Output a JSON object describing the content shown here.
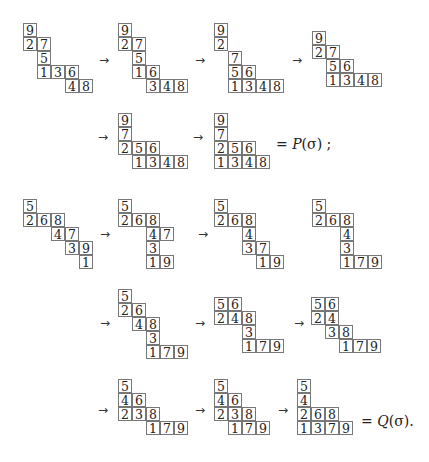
{
  "cell_size": 14,
  "arrow_glyph": "→",
  "tableaux": [
    {
      "id": "p1",
      "x": 23,
      "y": 23,
      "rows": [
        [
          0,
          "9"
        ],
        [
          0,
          "27"
        ],
        [
          1,
          "5"
        ],
        [
          1,
          "136"
        ],
        [
          3,
          "48"
        ]
      ]
    },
    {
      "id": "p2",
      "x": 118,
      "y": 23,
      "rows": [
        [
          0,
          "9"
        ],
        [
          0,
          "27"
        ],
        [
          1,
          "5"
        ],
        [
          1,
          "16"
        ],
        [
          2,
          "348"
        ]
      ]
    },
    {
      "id": "p3",
      "x": 214,
      "y": 23,
      "rows": [
        [
          0,
          "9"
        ],
        [
          0,
          "2"
        ],
        [
          1,
          "7"
        ],
        [
          1,
          "56"
        ],
        [
          1,
          "1348"
        ]
      ]
    },
    {
      "id": "p4",
      "x": 312,
      "y": 31,
      "rows": [
        [
          0,
          "9"
        ],
        [
          0,
          "27"
        ],
        [
          1,
          "56"
        ],
        [
          1,
          "1348"
        ]
      ]
    },
    {
      "id": "p5",
      "x": 118,
      "y": 113,
      "rows": [
        [
          0,
          "9"
        ],
        [
          0,
          "7"
        ],
        [
          0,
          "256"
        ],
        [
          1,
          "1348"
        ]
      ]
    },
    {
      "id": "p6",
      "x": 214,
      "y": 113,
      "rows": [
        [
          0,
          "9"
        ],
        [
          0,
          "7"
        ],
        [
          0,
          "256"
        ],
        [
          0,
          "1348"
        ]
      ]
    },
    {
      "id": "q1",
      "x": 23,
      "y": 199,
      "rows": [
        [
          0,
          "5"
        ],
        [
          0,
          "268"
        ],
        [
          2,
          "47"
        ],
        [
          3,
          "39"
        ],
        [
          4,
          "1"
        ]
      ]
    },
    {
      "id": "q2",
      "x": 118,
      "y": 199,
      "rows": [
        [
          0,
          "5"
        ],
        [
          0,
          "268"
        ],
        [
          2,
          "47"
        ],
        [
          2,
          "3"
        ],
        [
          2,
          "19"
        ]
      ]
    },
    {
      "id": "q3",
      "x": 214,
      "y": 199,
      "rows": [
        [
          0,
          "5"
        ],
        [
          0,
          "268"
        ],
        [
          2,
          "4"
        ],
        [
          2,
          "37"
        ],
        [
          3,
          "19"
        ]
      ]
    },
    {
      "id": "q4",
      "x": 312,
      "y": 199,
      "rows": [
        [
          0,
          "5"
        ],
        [
          0,
          "268"
        ],
        [
          2,
          "4"
        ],
        [
          2,
          "3"
        ],
        [
          2,
          "179"
        ]
      ]
    },
    {
      "id": "q5",
      "x": 118,
      "y": 289,
      "rows": [
        [
          0,
          "5"
        ],
        [
          0,
          "26"
        ],
        [
          1,
          "48"
        ],
        [
          2,
          "3"
        ],
        [
          2,
          "179"
        ]
      ]
    },
    {
      "id": "q6",
      "x": 214,
      "y": 297,
      "rows": [
        [
          0,
          "56"
        ],
        [
          0,
          "248"
        ],
        [
          2,
          "3"
        ],
        [
          2,
          "179"
        ]
      ]
    },
    {
      "id": "q7",
      "x": 311,
      "y": 297,
      "rows": [
        [
          0,
          "56"
        ],
        [
          0,
          "24"
        ],
        [
          1,
          "38"
        ],
        [
          2,
          "179"
        ]
      ]
    },
    {
      "id": "q8",
      "x": 118,
      "y": 379,
      "rows": [
        [
          0,
          "5"
        ],
        [
          0,
          "46"
        ],
        [
          0,
          "238"
        ],
        [
          2,
          "179"
        ]
      ]
    },
    {
      "id": "q9",
      "x": 214,
      "y": 379,
      "rows": [
        [
          0,
          "5"
        ],
        [
          0,
          "46"
        ],
        [
          0,
          "238"
        ],
        [
          1,
          "179"
        ]
      ]
    },
    {
      "id": "q10",
      "x": 297,
      "y": 379,
      "rows": [
        [
          0,
          "5"
        ],
        [
          0,
          "4"
        ],
        [
          0,
          "268"
        ],
        [
          0,
          "1379"
        ]
      ]
    }
  ],
  "arrows": [
    {
      "x": 99,
      "y": 54
    },
    {
      "x": 195,
      "y": 54
    },
    {
      "x": 292,
      "y": 54
    },
    {
      "x": 98,
      "y": 131
    },
    {
      "x": 193,
      "y": 131
    },
    {
      "x": 100,
      "y": 228
    },
    {
      "x": 198,
      "y": 228
    },
    {
      "x": 100,
      "y": 317
    },
    {
      "x": 195,
      "y": 317
    },
    {
      "x": 294,
      "y": 317
    },
    {
      "x": 98,
      "y": 404
    },
    {
      "x": 195,
      "y": 404
    },
    {
      "x": 278,
      "y": 404
    }
  ],
  "labels": {
    "p_result": {
      "prefix": "= ",
      "func": "P",
      "arg": "(σ)",
      "suffix": ";"
    },
    "q_result": {
      "prefix": "= ",
      "func": "Q",
      "arg": "(σ)",
      "suffix": "."
    }
  }
}
